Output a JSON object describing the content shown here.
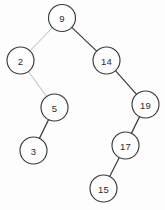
{
  "diagram": {
    "type": "binary-tree",
    "width": 165,
    "height": 210,
    "background_color": "#fdfdfd",
    "node_radius": 13.5,
    "node_fill": "#fefefe",
    "node_stroke": "#3a3a3a",
    "edge_color_dark": "#3a3a3a",
    "edge_color_light": "#b9b6b4",
    "label_color": "#2b2b2b",
    "nodes": [
      {
        "id": "n9",
        "label": "9",
        "cx": 62,
        "cy": 18,
        "r": 13.5
      },
      {
        "id": "n2",
        "label": "2",
        "cx": 20.5,
        "cy": 60.5,
        "r": 13.5
      },
      {
        "id": "n14",
        "label": "14",
        "cx": 106.5,
        "cy": 60.5,
        "r": 13.5
      },
      {
        "id": "n5",
        "label": "5",
        "cx": 54.5,
        "cy": 107.5,
        "r": 13.5
      },
      {
        "id": "n19",
        "label": "19",
        "cx": 145.5,
        "cy": 104.5,
        "r": 13.5
      },
      {
        "id": "n3",
        "label": "3",
        "cx": 33.5,
        "cy": 150.5,
        "r": 13.5
      },
      {
        "id": "n17",
        "label": "17",
        "cx": 125.5,
        "cy": 145.5,
        "r": 13.5
      },
      {
        "id": "n15",
        "label": "15",
        "cx": 103.5,
        "cy": 188.5,
        "r": 13.5
      }
    ],
    "edges": [
      {
        "id": "e9-2",
        "from": "n9",
        "to": "n2",
        "relation": "left",
        "shade": "light"
      },
      {
        "id": "e9-14",
        "from": "n9",
        "to": "n14",
        "relation": "right",
        "shade": "dark"
      },
      {
        "id": "e2-5",
        "from": "n2",
        "to": "n5",
        "relation": "right",
        "shade": "light"
      },
      {
        "id": "e14-19",
        "from": "n14",
        "to": "n19",
        "relation": "right",
        "shade": "dark"
      },
      {
        "id": "e5-3",
        "from": "n5",
        "to": "n3",
        "relation": "left",
        "shade": "dark"
      },
      {
        "id": "e19-17",
        "from": "n19",
        "to": "n17",
        "relation": "left",
        "shade": "dark"
      },
      {
        "id": "e17-15",
        "from": "n17",
        "to": "n15",
        "relation": "left",
        "shade": "dark"
      }
    ]
  }
}
